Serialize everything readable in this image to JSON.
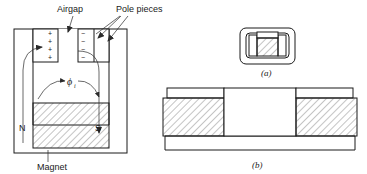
{
  "figure": {
    "title_labels": {
      "airgap": "Airgap",
      "pole_pieces": "Pole pieces",
      "magnet": "Magnet"
    },
    "polarity": {
      "north": "N",
      "south": "S",
      "plus": "+",
      "minus": "−",
      "plus_count": 4,
      "minus_count": 4
    },
    "flux": {
      "symbol": "ϕ",
      "subscript": "i"
    },
    "captions": {
      "a": "(a)",
      "b": "(b)"
    },
    "colors": {
      "line": "#1a1a1a",
      "hatch": "#555555",
      "background": "#ffffff"
    }
  }
}
